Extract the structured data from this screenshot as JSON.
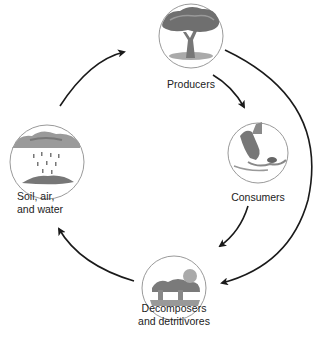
{
  "diagram": {
    "type": "cycle",
    "nodes": [
      {
        "id": "producers",
        "label_lines": [
          "Producers"
        ],
        "icon": "tree-icon"
      },
      {
        "id": "consumers",
        "label_lines": [
          "Consumers"
        ],
        "icon": "hawk-and-mouse-icon"
      },
      {
        "id": "decomposers",
        "label_lines": [
          "Decomposers",
          "and detritivores"
        ],
        "icon": "mushrooms-icon"
      },
      {
        "id": "soil",
        "label_lines": [
          "Soil, air,",
          "and water"
        ],
        "icon": "rain-cloud-icon"
      }
    ],
    "edges": [
      {
        "from": "soil",
        "to": "producers"
      },
      {
        "from": "producers",
        "to": "consumers"
      },
      {
        "from": "producers",
        "to": "decomposers"
      },
      {
        "from": "consumers",
        "to": "decomposers"
      },
      {
        "from": "decomposers",
        "to": "soil"
      }
    ],
    "colors": {
      "arrow": "#1a1a1a",
      "circle_stroke": "#9a9a9a",
      "illustration": "#6e6e6e"
    }
  }
}
